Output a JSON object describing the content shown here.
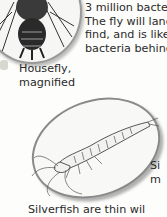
{
  "body_text": {
    "lines": [
      "3 million bacte",
      "The fly will lanc",
      "find, and is like",
      "bacteria behinc"
    ]
  },
  "captions": {
    "housefly": [
      "Housefly,",
      "magnified"
    ],
    "silverfish": [
      "Si",
      "m"
    ]
  },
  "bottom_text": "Silverfish are thin wil",
  "illustrations": {
    "housefly": "housefly-magnified-illustration",
    "silverfish": "silverfish-magnified-illustration"
  }
}
